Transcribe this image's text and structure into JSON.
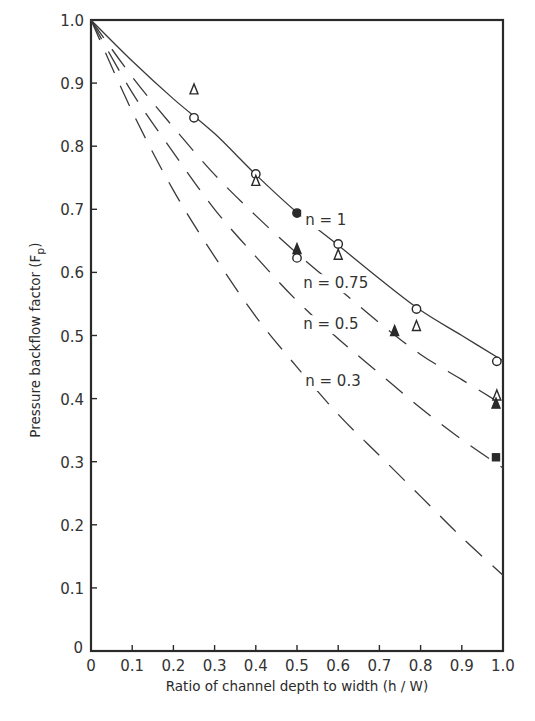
{
  "chart_data": {
    "type": "line",
    "title": "",
    "xlabel": "Ratio of channel depth to width (h / W)",
    "ylabel": "Pressure backflow factor (F",
    "ylabel_subscript": "p",
    "ylabel_close": ")",
    "xlim": [
      0,
      1.0
    ],
    "ylim": [
      0,
      1.0
    ],
    "grid": false,
    "legend_position": "inline labels",
    "x_ticks": [
      "0",
      "0.1",
      "0.2",
      "0.3",
      "0.4",
      "0.5",
      "0.6",
      "0.7",
      "0.8",
      "0.9",
      "1.0"
    ],
    "y_ticks": [
      "0",
      "0.1",
      "0.2",
      "0.3",
      "0.4",
      "0.5",
      "0.6",
      "0.7",
      "0.8",
      "0.9",
      "1.0"
    ],
    "x": [
      0,
      0.1,
      0.2,
      0.3,
      0.4,
      0.5,
      0.6,
      0.7,
      0.8,
      0.9,
      1.0
    ],
    "series": [
      {
        "name": "n = 1",
        "style": "solid",
        "values": [
          1.0,
          0.935,
          0.875,
          0.82,
          0.755,
          0.695,
          0.643,
          0.59,
          0.54,
          0.5,
          0.46
        ],
        "label_pos": [
          0.52,
          0.675
        ]
      },
      {
        "name": "n = 0.75",
        "style": "dashed",
        "values": [
          1.0,
          0.91,
          0.83,
          0.755,
          0.69,
          0.63,
          0.575,
          0.52,
          0.47,
          0.43,
          0.39
        ],
        "label_pos": [
          0.515,
          0.575
        ]
      },
      {
        "name": "n = 0.5",
        "style": "dashed",
        "values": [
          1.0,
          0.885,
          0.79,
          0.7,
          0.625,
          0.555,
          0.495,
          0.44,
          0.385,
          0.335,
          0.29
        ],
        "label_pos": [
          0.515,
          0.51
        ]
      },
      {
        "name": "n = 0.3",
        "style": "dashed",
        "values": [
          1.0,
          0.855,
          0.73,
          0.625,
          0.53,
          0.45,
          0.375,
          0.31,
          0.245,
          0.18,
          0.12
        ],
        "label_pos": [
          0.52,
          0.42
        ]
      }
    ],
    "markers": [
      {
        "shape": "open-triangle",
        "x": 0.25,
        "y": 0.89
      },
      {
        "shape": "open-circle",
        "x": 0.25,
        "y": 0.845
      },
      {
        "shape": "open-circle",
        "x": 0.4,
        "y": 0.756
      },
      {
        "shape": "open-triangle",
        "x": 0.4,
        "y": 0.745
      },
      {
        "shape": "filled-circle",
        "x": 0.5,
        "y": 0.694
      },
      {
        "shape": "filled-triangle",
        "x": 0.5,
        "y": 0.637
      },
      {
        "shape": "open-circle",
        "x": 0.5,
        "y": 0.623
      },
      {
        "shape": "open-circle",
        "x": 0.6,
        "y": 0.645
      },
      {
        "shape": "open-triangle",
        "x": 0.6,
        "y": 0.628
      },
      {
        "shape": "filled-triangle",
        "x": 0.737,
        "y": 0.507
      },
      {
        "shape": "open-circle",
        "x": 0.79,
        "y": 0.542
      },
      {
        "shape": "open-triangle",
        "x": 0.79,
        "y": 0.515
      },
      {
        "shape": "open-circle",
        "x": 0.985,
        "y": 0.459
      },
      {
        "shape": "open-triangle",
        "x": 0.985,
        "y": 0.405
      },
      {
        "shape": "filled-triangle",
        "x": 0.983,
        "y": 0.392
      },
      {
        "shape": "filled-square",
        "x": 0.983,
        "y": 0.307
      }
    ]
  },
  "colors": {
    "ink": "#2a2a2a",
    "background": "#ffffff"
  }
}
